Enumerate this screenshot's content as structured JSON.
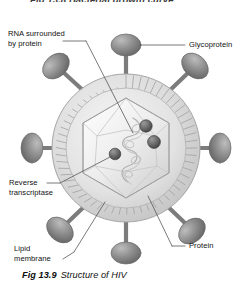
{
  "page": {
    "partial_heading_above": "Fig 13.8  Bacterial growth curve",
    "background_color": "#ffffff"
  },
  "caption": {
    "figure_number": "Fig 13.9",
    "title": "Structure of HIV"
  },
  "diagram": {
    "name": "hiv-virion-structure",
    "colors": {
      "envelope_fill": "#d8d8d8",
      "envelope_stroke": "#9a9a9a",
      "capsid_fill": "#e9e9e9",
      "capsid_stroke": "#a8a8a8",
      "spike_fill": "#8e8e8e",
      "spike_stroke": "#6f6f6f",
      "enzyme_sphere": "#6a6a6a",
      "rna_stroke": "#b5b5b5",
      "leader_line": "#555555",
      "text": "#111111"
    },
    "labels": [
      {
        "id": "rna-surrounded-by-protein",
        "line1": "RNA surrounded",
        "line2": "by protein",
        "position": "top-left"
      },
      {
        "id": "glycoprotein",
        "line1": "Glycoprotein",
        "line2": "",
        "position": "top-right"
      },
      {
        "id": "reverse-transcriptase",
        "line1": "Reverse",
        "line2": "transcriptase",
        "position": "mid-left"
      },
      {
        "id": "protein",
        "line1": "Protein",
        "line2": "",
        "position": "bottom-right"
      },
      {
        "id": "lipid-membrane",
        "line1": "Lipid",
        "line2": "membrane",
        "position": "bottom-left"
      }
    ],
    "parts": {
      "envelope": "lipid membrane envelope with radial striations",
      "capsid": "hexagonal protein capsid core",
      "rna": "coiled RNA strand inside capsid",
      "enzymes": "three reverse transcriptase spheres",
      "spikes_count": 8
    }
  }
}
